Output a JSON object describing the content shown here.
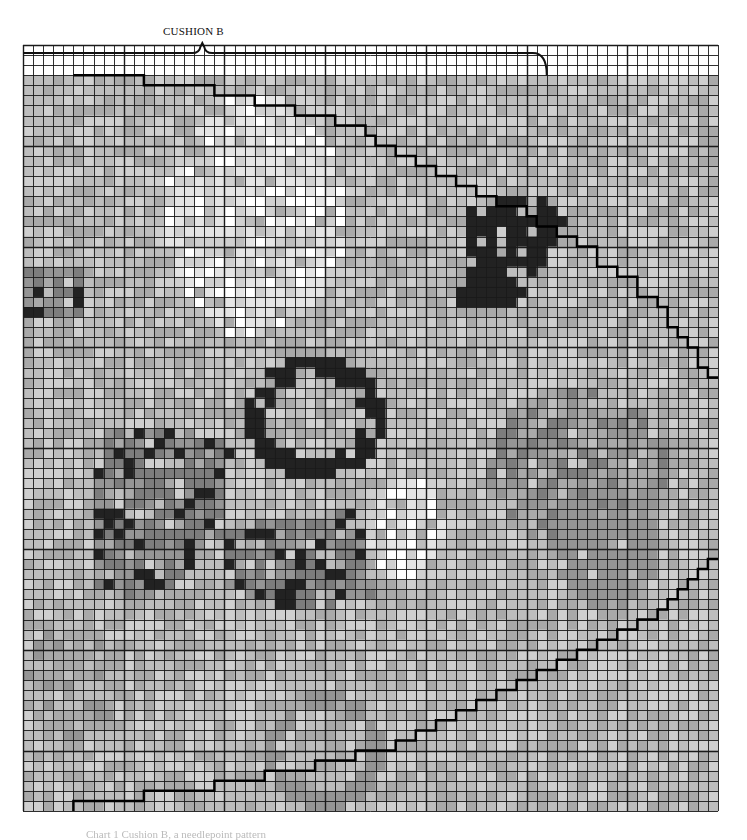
{
  "chart": {
    "title": "CUSHION B",
    "type": "needlepoint-chart",
    "grid": {
      "left": 23,
      "top": 45,
      "right": 718,
      "bottom": 811,
      "cols": 69,
      "rows": 76,
      "line_color": "#1a1a1a",
      "major_every": 10
    },
    "palette": [
      "#ffffff",
      "#e4e4e4",
      "#cfcfcf",
      "#bdbdbd",
      "#a9a9a9",
      "#959595",
      "#7d7d7d",
      "#222222"
    ],
    "base_level": 3,
    "top_blank_rows": 3,
    "regions": [
      {
        "name": "light-oval-top-center",
        "shape": "ellipse",
        "cx": 23,
        "cy": 17,
        "rx": 9,
        "ry": 12,
        "level": 1,
        "noise": 2
      },
      {
        "name": "dark-blob-upper-right",
        "shape": "poly",
        "pts": [
          [
            44,
            16
          ],
          [
            51,
            15
          ],
          [
            55,
            17
          ],
          [
            52,
            21
          ],
          [
            49,
            26
          ],
          [
            43,
            26
          ],
          [
            44,
            22
          ]
        ],
        "level": 7,
        "noise": 0
      },
      {
        "name": "dark-ring-center",
        "shape": "ring",
        "cx": 29,
        "cy": 37,
        "rx": 7,
        "ry": 6,
        "w": 2,
        "level": 7
      },
      {
        "name": "dark-cluster-left-mid",
        "shape": "poly",
        "pts": [
          [
            8,
            38
          ],
          [
            16,
            38
          ],
          [
            21,
            40
          ],
          [
            20,
            48
          ],
          [
            14,
            55
          ],
          [
            7,
            54
          ],
          [
            7,
            46
          ]
        ],
        "level": 6,
        "noise": 2
      },
      {
        "name": "dark-patches-lower-mid",
        "shape": "poly",
        "pts": [
          [
            20,
            48
          ],
          [
            33,
            46
          ],
          [
            35,
            55
          ],
          [
            27,
            56
          ],
          [
            20,
            54
          ]
        ],
        "level": 6,
        "noise": 2
      },
      {
        "name": "dark-left-edge-bits",
        "shape": "rect",
        "x": 0,
        "y": 22,
        "w": 6,
        "h": 5,
        "level": 6,
        "noise": 2
      },
      {
        "name": "grey-swirl-right",
        "shape": "ellipse",
        "cx": 55,
        "cy": 42,
        "rx": 9,
        "ry": 8,
        "level": 5,
        "noise": 2
      },
      {
        "name": "grey-band-lower-right",
        "shape": "ellipse",
        "cx": 58,
        "cy": 50,
        "rx": 5,
        "ry": 6,
        "level": 5,
        "noise": 1
      },
      {
        "name": "light-spots-center-right",
        "shape": "ellipse",
        "cx": 38,
        "cy": 48,
        "rx": 4,
        "ry": 5,
        "level": 1,
        "noise": 2
      },
      {
        "name": "grey-arch-bottom",
        "shape": "ring",
        "cx": 30,
        "cy": 70,
        "rx": 6,
        "ry": 6,
        "w": 2,
        "level": 5
      },
      {
        "name": "grey-cluster-bottom-left",
        "shape": "ellipse",
        "cx": 5,
        "cy": 63,
        "rx": 5,
        "ry": 6,
        "level": 4,
        "noise": 2
      }
    ],
    "outlines": [
      {
        "name": "upper-staircase-boundary",
        "points_cells": [
          [
            5,
            3
          ],
          [
            12,
            3
          ],
          [
            12,
            4
          ],
          [
            19,
            4
          ],
          [
            19,
            5
          ],
          [
            23,
            5
          ],
          [
            23,
            6
          ],
          [
            27,
            6
          ],
          [
            27,
            7
          ],
          [
            31,
            7
          ],
          [
            31,
            8
          ],
          [
            34,
            8
          ],
          [
            34,
            9
          ],
          [
            35,
            9
          ],
          [
            35,
            10
          ],
          [
            37,
            10
          ],
          [
            37,
            11
          ],
          [
            39,
            11
          ],
          [
            39,
            12
          ],
          [
            41,
            12
          ],
          [
            41,
            13
          ],
          [
            43,
            13
          ],
          [
            43,
            14
          ],
          [
            45,
            14
          ],
          [
            45,
            15
          ],
          [
            47,
            15
          ],
          [
            47,
            16
          ],
          [
            50,
            16
          ],
          [
            50,
            17
          ],
          [
            51,
            17
          ],
          [
            51,
            18
          ],
          [
            53,
            18
          ],
          [
            53,
            19
          ],
          [
            55,
            19
          ],
          [
            55,
            20
          ],
          [
            57,
            20
          ],
          [
            57,
            22
          ],
          [
            59,
            22
          ],
          [
            59,
            23
          ],
          [
            61,
            23
          ],
          [
            61,
            25
          ],
          [
            63,
            25
          ],
          [
            63,
            26
          ],
          [
            64,
            26
          ],
          [
            64,
            28
          ],
          [
            65,
            28
          ],
          [
            65,
            29
          ],
          [
            66,
            29
          ],
          [
            66,
            30
          ],
          [
            67,
            30
          ],
          [
            67,
            32
          ],
          [
            68,
            32
          ],
          [
            68,
            33
          ],
          [
            69,
            33
          ]
        ]
      },
      {
        "name": "lower-staircase-boundary",
        "points_cells": [
          [
            5,
            76
          ],
          [
            5,
            75
          ],
          [
            12,
            75
          ],
          [
            12,
            74
          ],
          [
            19,
            74
          ],
          [
            19,
            73
          ],
          [
            24,
            73
          ],
          [
            24,
            72
          ],
          [
            29,
            72
          ],
          [
            29,
            71
          ],
          [
            33,
            71
          ],
          [
            33,
            70
          ],
          [
            37,
            70
          ],
          [
            37,
            69
          ],
          [
            39,
            69
          ],
          [
            39,
            68
          ],
          [
            41,
            68
          ],
          [
            41,
            67
          ],
          [
            43,
            67
          ],
          [
            43,
            66
          ],
          [
            45,
            66
          ],
          [
            45,
            65
          ],
          [
            47,
            65
          ],
          [
            47,
            64
          ],
          [
            49,
            64
          ],
          [
            49,
            63
          ],
          [
            51,
            63
          ],
          [
            51,
            62
          ],
          [
            53,
            62
          ],
          [
            53,
            61
          ],
          [
            55,
            61
          ],
          [
            55,
            60
          ],
          [
            57,
            60
          ],
          [
            57,
            59
          ],
          [
            59,
            59
          ],
          [
            59,
            58
          ],
          [
            61,
            58
          ],
          [
            61,
            57
          ],
          [
            63,
            57
          ],
          [
            63,
            56
          ],
          [
            64,
            56
          ],
          [
            64,
            55
          ],
          [
            65,
            55
          ],
          [
            65,
            54
          ],
          [
            66,
            54
          ],
          [
            66,
            53
          ],
          [
            67,
            53
          ],
          [
            67,
            52
          ],
          [
            68,
            52
          ],
          [
            68,
            51
          ],
          [
            69,
            51
          ]
        ]
      }
    ],
    "brace": {
      "label": "CUSHION B",
      "x1_cell": 0,
      "x2_cell": 52,
      "row_cell": 1,
      "tip_cell": 18,
      "hook_down_to_row": 3
    }
  },
  "footer": {
    "caption": "Chart 1 Cushion B, a needlepoint pattern"
  }
}
